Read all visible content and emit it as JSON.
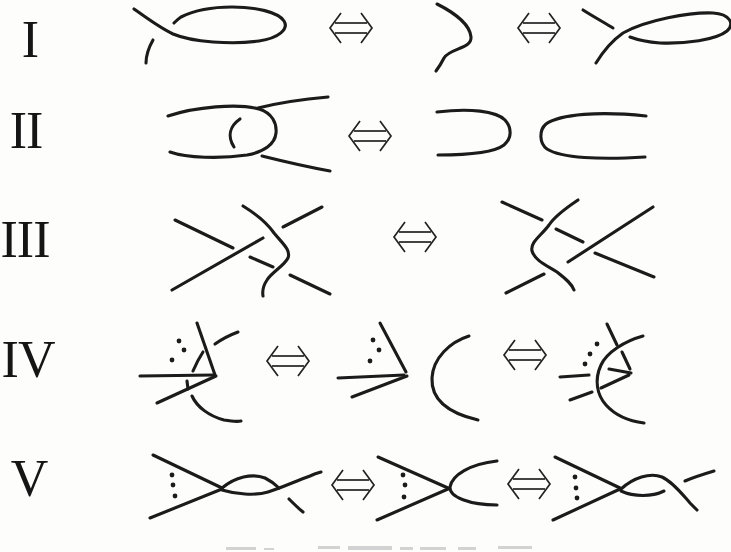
{
  "page": {
    "background": "#fdfdfc",
    "ink_color": "#1b1b1b",
    "caption_cut_off": true
  },
  "figure": {
    "kind": "reidemeister-moves-diagram",
    "equivalence_arrow_glyph": "⇔",
    "rows": [
      {
        "numeral": "I",
        "arrows": 2
      },
      {
        "numeral": "II",
        "arrows": 1
      },
      {
        "numeral": "III",
        "arrows": 1
      },
      {
        "numeral": "IV",
        "arrows": 2
      },
      {
        "numeral": "V",
        "arrows": 2
      }
    ]
  }
}
